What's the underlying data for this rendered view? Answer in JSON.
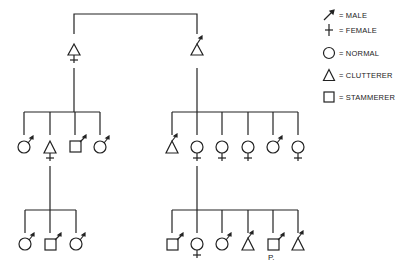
{
  "legend": {
    "items": [
      {
        "symbol": "male-arrow",
        "label": "= MALE"
      },
      {
        "symbol": "female-cross",
        "label": "= FEMALE"
      },
      {
        "symbol": "circle",
        "label": "= NORMAL"
      },
      {
        "symbol": "triangle",
        "label": "= CLUTTERER"
      },
      {
        "symbol": "square",
        "label": "= STAMMERER"
      }
    ]
  },
  "pedigree": {
    "generation1": [
      {
        "id": "g1-mother",
        "shape": "triangle",
        "sex": "female",
        "status": "clutterer"
      },
      {
        "id": "g1-father",
        "shape": "triangle",
        "sex": "male",
        "status": "clutterer"
      }
    ],
    "generation2_left": [
      {
        "shape": "circle",
        "sex": "male",
        "status": "normal"
      },
      {
        "shape": "triangle",
        "sex": "female",
        "status": "clutterer"
      },
      {
        "shape": "square",
        "sex": "male",
        "status": "stammerer"
      },
      {
        "shape": "circle",
        "sex": "male",
        "status": "normal"
      }
    ],
    "generation2_right": [
      {
        "shape": "triangle",
        "sex": "male",
        "status": "clutterer"
      },
      {
        "shape": "circle",
        "sex": "female",
        "status": "normal"
      },
      {
        "shape": "circle",
        "sex": "female",
        "status": "normal"
      },
      {
        "shape": "circle",
        "sex": "female",
        "status": "normal"
      },
      {
        "shape": "circle",
        "sex": "male",
        "status": "normal"
      },
      {
        "shape": "circle",
        "sex": "female",
        "status": "normal"
      }
    ],
    "generation3_left": [
      {
        "shape": "circle",
        "sex": "male",
        "status": "normal"
      },
      {
        "shape": "square",
        "sex": "male",
        "status": "stammerer"
      },
      {
        "shape": "circle",
        "sex": "male",
        "status": "normal"
      }
    ],
    "generation3_right": [
      {
        "shape": "square",
        "sex": "male",
        "status": "stammerer"
      },
      {
        "shape": "circle",
        "sex": "female",
        "status": "normal"
      },
      {
        "shape": "circle",
        "sex": "male",
        "status": "normal"
      },
      {
        "shape": "triangle",
        "sex": "male",
        "status": "clutterer"
      },
      {
        "shape": "square",
        "sex": "male",
        "status": "stammerer",
        "note": "P."
      },
      {
        "shape": "triangle",
        "sex": "male",
        "status": "clutterer"
      }
    ],
    "proband_label": "P."
  }
}
